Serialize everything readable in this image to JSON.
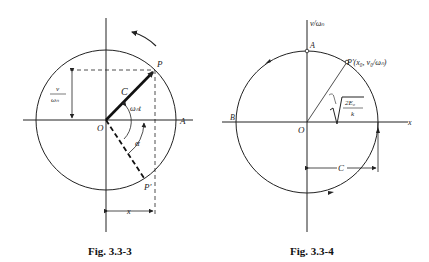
{
  "figures": [
    {
      "id": "left",
      "caption": "Fig. 3.3-3",
      "labels": {
        "P": "P",
        "P_prime": "P'",
        "O": "O",
        "A": "A",
        "C": "C",
        "omega_t": "ωₙt",
        "alpha": "α",
        "x": "x",
        "v_num": "v",
        "v_den": "ωₙ"
      }
    },
    {
      "id": "right",
      "caption": "Fig. 3.3-4",
      "labels": {
        "y_axis": "v/ωₙ",
        "x_axis": "x",
        "A": "A",
        "B": "B",
        "O": "O",
        "P_prime": "P'(x₀, v₀/ωₙ)",
        "radius_num": "2E₀",
        "radius_den": "k",
        "C": "C"
      }
    }
  ]
}
